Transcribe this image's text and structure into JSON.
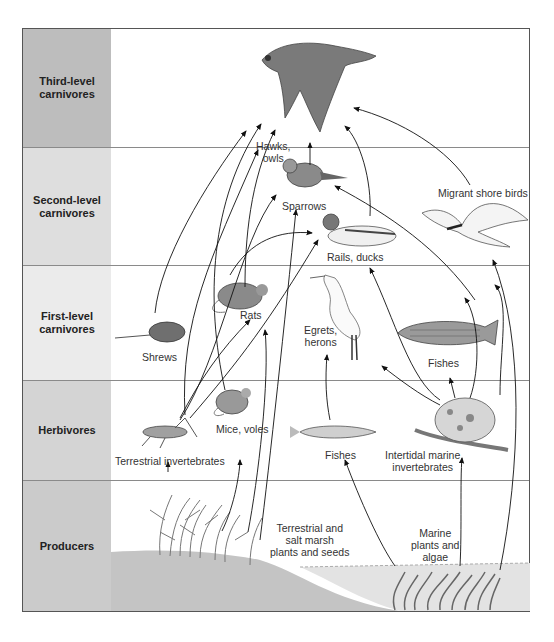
{
  "diagram": {
    "type": "food web",
    "trophic_levels": [
      {
        "id": "third",
        "label": "Third-level carnivores",
        "line1": "Third-level",
        "line2": "carnivores",
        "color": "#bdbdbd"
      },
      {
        "id": "second",
        "label": "Second-level carnivores",
        "line1": "Second-level",
        "line2": "carnivores",
        "color": "#dcdcdc"
      },
      {
        "id": "first",
        "label": "First-level carnivores",
        "line1": "First-level",
        "line2": "carnivores",
        "color": "#e8e8e8"
      },
      {
        "id": "herb",
        "label": "Herbivores",
        "line1": "Herbivores",
        "line2": "",
        "color": "#d2d2d2"
      },
      {
        "id": "prod",
        "label": "Producers",
        "line1": "Producers",
        "line2": "",
        "color": "#c9c9c9"
      }
    ],
    "organisms": {
      "hawks": {
        "line1": "Hawks,",
        "line2": "owls"
      },
      "sparrows": {
        "line1": "Sparrows"
      },
      "migrant": {
        "line1": "Migrant shore birds"
      },
      "rails": {
        "line1": "Rails, ducks"
      },
      "rats": {
        "line1": "Rats"
      },
      "shrews": {
        "line1": "Shrews"
      },
      "egrets": {
        "line1": "Egrets,",
        "line2": "herons"
      },
      "fishes_first": {
        "line1": "Fishes"
      },
      "mice": {
        "line1": "Mice, voles"
      },
      "terr_inv": {
        "line1": "Terrestrial invertebrates"
      },
      "fishes_herb": {
        "line1": "Fishes"
      },
      "marine_inv": {
        "line1": "Intertidal marine",
        "line2": "invertebrates"
      },
      "terr_plants": {
        "line1": "Terrestrial and",
        "line2": "salt marsh",
        "line3": "plants and seeds"
      },
      "marine_plants": {
        "line1": "Marine",
        "line2": "plants and",
        "line3": "algae"
      }
    },
    "links": [
      {
        "from": "Terrestrial and salt marsh plants and seeds",
        "to": "Terrestrial invertebrates"
      },
      {
        "from": "Terrestrial and salt marsh plants and seeds",
        "to": "Mice, voles"
      },
      {
        "from": "Terrestrial and salt marsh plants and seeds",
        "to": "Rats"
      },
      {
        "from": "Terrestrial and salt marsh plants and seeds",
        "to": "Sparrows"
      },
      {
        "from": "Marine plants and algae",
        "to": "Fishes (herbivores)"
      },
      {
        "from": "Marine plants and algae",
        "to": "Intertidal marine invertebrates"
      },
      {
        "from": "Marine plants and algae",
        "to": "Rails, ducks"
      },
      {
        "from": "Terrestrial invertebrates",
        "to": "Shrews"
      },
      {
        "from": "Terrestrial invertebrates",
        "to": "Rats"
      },
      {
        "from": "Terrestrial invertebrates",
        "to": "Sparrows"
      },
      {
        "from": "Terrestrial invertebrates",
        "to": "Rails, ducks"
      },
      {
        "from": "Mice, voles",
        "to": "Hawks, owls"
      },
      {
        "from": "Shrews",
        "to": "Hawks, owls"
      },
      {
        "from": "Rats",
        "to": "Hawks, owls"
      },
      {
        "from": "Fishes (herbivores)",
        "to": "Egrets, herons"
      },
      {
        "from": "Intertidal marine invertebrates",
        "to": "Egrets, herons"
      },
      {
        "from": "Intertidal marine invertebrates",
        "to": "Fishes (first-level)"
      },
      {
        "from": "Intertidal marine invertebrates",
        "to": "Rails, ducks"
      },
      {
        "from": "Intertidal marine invertebrates",
        "to": "Migrant shore birds"
      },
      {
        "from": "Intertidal marine invertebrates",
        "to": "Sparrows"
      },
      {
        "from": "Sparrows",
        "to": "Hawks, owls"
      },
      {
        "from": "Rails, ducks",
        "to": "Hawks, owls"
      },
      {
        "from": "Migrant shore birds",
        "to": "Hawks, owls"
      }
    ]
  }
}
